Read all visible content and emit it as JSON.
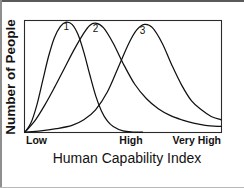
{
  "chart_data": {
    "type": "line",
    "title": "",
    "xlabel": "Human Capability Index",
    "ylabel": "Number of People",
    "grid": false,
    "legend_position": "inline-curve-labels",
    "xlim": [
      0,
      100
    ],
    "ylim": [
      0,
      100
    ],
    "xtick_labels": [
      "Low",
      "High",
      "Very High"
    ],
    "xtick_positions": [
      0,
      54,
      88
    ],
    "ytick_labels": [],
    "annotations": [
      {
        "text": "1",
        "x": 21,
        "y": 92
      },
      {
        "text": "2",
        "x": 36,
        "y": 90
      },
      {
        "text": "3",
        "x": 60,
        "y": 88
      }
    ],
    "series": [
      {
        "name": "1",
        "label": "1",
        "color": "#111111",
        "description": "Right-skewed distribution peaking at low capability",
        "x": [
          0,
          3,
          6,
          9,
          12,
          15,
          18,
          21,
          24,
          27,
          30,
          33,
          36,
          39,
          42,
          45,
          50,
          55,
          60
        ],
        "y": [
          0,
          8,
          24,
          46,
          68,
          85,
          95,
          99,
          97,
          88,
          72,
          52,
          33,
          19,
          10,
          5,
          1,
          0,
          0
        ]
      },
      {
        "name": "2",
        "label": "2",
        "color": "#111111",
        "description": "Broad distribution peaking at mid capability with a long right tail",
        "x": [
          0,
          5,
          10,
          15,
          20,
          25,
          30,
          33,
          36,
          40,
          45,
          50,
          56,
          62,
          68,
          74,
          80,
          86,
          92,
          100
        ],
        "y": [
          0,
          10,
          24,
          40,
          57,
          74,
          89,
          96,
          98,
          94,
          80,
          62,
          43,
          30,
          21,
          15,
          11,
          8,
          6,
          5
        ]
      },
      {
        "name": "3",
        "label": "3",
        "color": "#111111",
        "description": "Late-rising distribution peaking near high capability with a long right tail",
        "x": [
          0,
          8,
          16,
          24,
          30,
          36,
          42,
          48,
          53,
          57,
          61,
          65,
          70,
          75,
          80,
          85,
          90,
          95,
          100
        ],
        "y": [
          0,
          1,
          3,
          6,
          11,
          20,
          36,
          60,
          80,
          92,
          97,
          94,
          80,
          60,
          42,
          28,
          20,
          14,
          11
        ]
      }
    ]
  },
  "axes": {
    "y_title": "Number of People",
    "x_title": "Human Capability Index",
    "x_ticks": [
      {
        "label": "Low"
      },
      {
        "label": "High"
      },
      {
        "label": "Very High"
      }
    ]
  },
  "curve_labels": [
    {
      "label": "1"
    },
    {
      "label": "2"
    },
    {
      "label": "3"
    }
  ]
}
